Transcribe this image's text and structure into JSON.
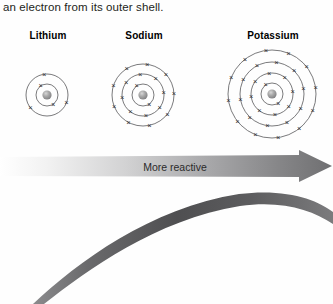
{
  "page": {
    "width": 333,
    "height": 304,
    "background_color": "#fefefe",
    "body_text": "an electron from its outer shell."
  },
  "atoms": {
    "nucleus_color": "#9a9a9a",
    "shell_stroke": "#58585a",
    "electron_symbol": "×",
    "items": [
      {
        "label": "Lithium",
        "element": "Li",
        "cx": 47,
        "cy": 51,
        "shells": [
          {
            "radius": 11,
            "electrons": 2
          },
          {
            "radius": 21,
            "electrons": 3
          }
        ]
      },
      {
        "label": "Sodium",
        "element": "Na",
        "cx": 143,
        "cy": 51,
        "shells": [
          {
            "radius": 11,
            "electrons": 2
          },
          {
            "radius": 21,
            "electrons": 8
          },
          {
            "radius": 31,
            "electrons": 9
          }
        ]
      },
      {
        "label": "Potassium",
        "element": "K",
        "cx": 272,
        "cy": 50,
        "shells": [
          {
            "radius": 11,
            "electrons": 2
          },
          {
            "radius": 21,
            "electrons": 8
          },
          {
            "radius": 32,
            "electrons": 10
          },
          {
            "radius": 44,
            "electrons": 12
          }
        ]
      }
    ]
  },
  "arrow": {
    "label": "More reactive",
    "direction": "right",
    "gradient_from": "#ffffff",
    "gradient_to": "#6f6f71"
  },
  "decoration": {
    "curve_color": "#5d5d5f",
    "name": "page-curl-arc"
  }
}
